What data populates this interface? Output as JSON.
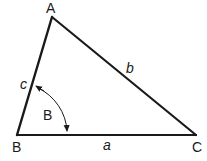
{
  "diagram": {
    "type": "triangle",
    "line_color": "#1a1a1a",
    "background": "#ffffff",
    "vertices": [
      {
        "id": "A",
        "label": "A",
        "x": 52,
        "y": 17
      },
      {
        "id": "B",
        "label": "B",
        "x": 17,
        "y": 135
      },
      {
        "id": "C",
        "label": "C",
        "x": 196,
        "y": 135
      }
    ],
    "sides": [
      {
        "id": "a",
        "label": "a",
        "between": [
          "B",
          "C"
        ]
      },
      {
        "id": "b",
        "label": "b",
        "between": [
          "A",
          "C"
        ]
      },
      {
        "id": "c",
        "label": "c",
        "between": [
          "A",
          "B"
        ]
      }
    ],
    "angle": {
      "vertex": "B",
      "label": "B",
      "from_side": "c",
      "to_side": "a",
      "arrows": "both-ends"
    }
  }
}
